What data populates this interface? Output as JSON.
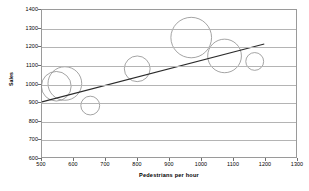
{
  "chart_data": {
    "type": "scatter",
    "title": "",
    "xlabel": "Pedestrians per hour",
    "ylabel": "Sales",
    "xlim": [
      500,
      1300
    ],
    "ylim": [
      600,
      1400
    ],
    "grid": true,
    "legend": null,
    "x_ticks": [
      500,
      600,
      700,
      800,
      900,
      1000,
      1100,
      1200,
      1300
    ],
    "y_ticks": [
      600,
      700,
      800,
      900,
      1000,
      1100,
      1200,
      1300,
      1400
    ],
    "x_tick_labels": [
      "500",
      "600",
      "700",
      "800",
      "900",
      "1000",
      "1100",
      "1200",
      "1300"
    ],
    "y_tick_labels": [
      "600",
      "700",
      "800",
      "900",
      "1000",
      "1100",
      "1200",
      "1300",
      "1400"
    ],
    "series": [
      {
        "name": "Stores",
        "marker": "bubble",
        "points": [
          {
            "x": 545,
            "y": 985,
            "size": 30
          },
          {
            "x": 572,
            "y": 1000,
            "size": 34
          },
          {
            "x": 652,
            "y": 880,
            "size": 19
          },
          {
            "x": 800,
            "y": 1080,
            "size": 26
          },
          {
            "x": 970,
            "y": 1250,
            "size": 41
          },
          {
            "x": 1075,
            "y": 1150,
            "size": 34
          },
          {
            "x": 1170,
            "y": 1120,
            "size": 18
          }
        ]
      }
    ],
    "trendline": {
      "type": "linear",
      "x_start": 500,
      "y_start": 900,
      "x_end": 1200,
      "y_end": 1215
    }
  },
  "caption": {
    "text": ""
  }
}
